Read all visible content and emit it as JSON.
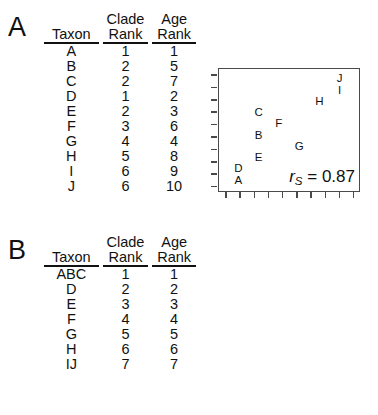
{
  "figure": {
    "panels": [
      {
        "letter": "A",
        "table": {
          "headers": {
            "taxon": "Taxon",
            "clade_top": "Clade",
            "clade_bottom": "Rank",
            "age_top": "Age",
            "age_bottom": "Rank"
          },
          "rows": [
            {
              "taxon": "A",
              "clade_rank": "1",
              "age_rank": "1"
            },
            {
              "taxon": "B",
              "clade_rank": "2",
              "age_rank": "5"
            },
            {
              "taxon": "C",
              "clade_rank": "2",
              "age_rank": "7"
            },
            {
              "taxon": "D",
              "clade_rank": "1",
              "age_rank": "2"
            },
            {
              "taxon": "E",
              "clade_rank": "2",
              "age_rank": "3"
            },
            {
              "taxon": "F",
              "clade_rank": "3",
              "age_rank": "6"
            },
            {
              "taxon": "G",
              "clade_rank": "4",
              "age_rank": "4"
            },
            {
              "taxon": "H",
              "clade_rank": "5",
              "age_rank": "8"
            },
            {
              "taxon": "I",
              "clade_rank": "6",
              "age_rank": "9"
            },
            {
              "taxon": "J",
              "clade_rank": "6",
              "age_rank": "10"
            }
          ]
        },
        "plot": {
          "rs_symbol": "r",
          "rs_subscript": "S",
          "rs_equals": "= 0.87",
          "y_ticks": 10,
          "x_ticks": 10
        }
      },
      {
        "letter": "B",
        "table": {
          "headers": {
            "taxon": "Taxon",
            "clade_top": "Clade",
            "clade_bottom": "Rank",
            "age_top": "Age",
            "age_bottom": "Rank"
          },
          "rows": [
            {
              "taxon": "ABC",
              "clade_rank": "1",
              "age_rank": "1"
            },
            {
              "taxon": "D",
              "clade_rank": "2",
              "age_rank": "2"
            },
            {
              "taxon": "E",
              "clade_rank": "3",
              "age_rank": "3"
            },
            {
              "taxon": "F",
              "clade_rank": "4",
              "age_rank": "4"
            },
            {
              "taxon": "G",
              "clade_rank": "5",
              "age_rank": "5"
            },
            {
              "taxon": "H",
              "clade_rank": "6",
              "age_rank": "6"
            },
            {
              "taxon": "IJ",
              "clade_rank": "7",
              "age_rank": "7"
            }
          ]
        },
        "plot": {
          "rs_symbol": "r",
          "rs_subscript": "S",
          "rs_equals": "= 1.00",
          "y_ticks": 7,
          "x_ticks": 9
        }
      }
    ]
  },
  "chart_data": [
    {
      "type": "scatter",
      "title": "A",
      "xlabel": "Clade Rank",
      "ylabel": "Age Rank",
      "xlim": [
        0,
        7
      ],
      "ylim": [
        0,
        11
      ],
      "grid": false,
      "legend": null,
      "annotations": [
        "r_S = 0.87"
      ],
      "point_labels": [
        "A",
        "B",
        "C",
        "D",
        "E",
        "F",
        "G",
        "H",
        "I",
        "J"
      ],
      "x": [
        1,
        2,
        2,
        1,
        2,
        3,
        4,
        5,
        6,
        6
      ],
      "y": [
        1,
        5,
        7,
        2,
        3,
        6,
        4,
        8,
        9,
        10
      ]
    },
    {
      "type": "scatter",
      "title": "B",
      "xlabel": "Clade Rank",
      "ylabel": "Age Rank",
      "xlim": [
        0,
        8
      ],
      "ylim": [
        0,
        8
      ],
      "grid": false,
      "legend": null,
      "annotations": [
        "r_S = 1.00"
      ],
      "point_labels": [
        "ABC",
        "D",
        "E",
        "F",
        "G",
        "H",
        "IJ"
      ],
      "x": [
        1,
        2,
        3,
        4,
        5,
        6,
        7
      ],
      "y": [
        1,
        2,
        3,
        4,
        5,
        6,
        7
      ]
    }
  ]
}
